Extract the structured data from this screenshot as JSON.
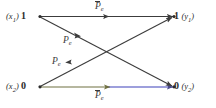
{
  "figure": {
    "type": "binary-symmetric-channel-diagram",
    "background_color": "#ffffff"
  },
  "nodes": {
    "input_top": {
      "paren_open": "(",
      "var": "x",
      "sub": "1",
      "paren_close": ")",
      "bit": "1"
    },
    "input_bottom": {
      "paren_open": "(",
      "var": "x",
      "sub": "2",
      "paren_close": ")",
      "bit": "0"
    },
    "output_top": {
      "paren_open": "(",
      "var": "y",
      "sub": "1",
      "paren_close": ")",
      "bit": "1"
    },
    "output_bottom": {
      "paren_open": "(",
      "var": "y",
      "sub": "2",
      "paren_close": ")",
      "bit": "0"
    }
  },
  "edges": {
    "top_straight": {
      "symbol": "P",
      "sub": "e",
      "overline": true,
      "label_text": "P̄e",
      "color": "#3c3c3c"
    },
    "bottom_straight": {
      "symbol": "P",
      "sub": "e",
      "overline": true,
      "label_text": "P̄e",
      "color": "#7c7fd0"
    },
    "cross_down": {
      "symbol": "P",
      "sub": "e",
      "overline": false,
      "label_text": "Pe",
      "color": "#3c3c3c"
    },
    "cross_up": {
      "symbol": "P",
      "sub": "e",
      "overline": false,
      "label_text": "Pe",
      "color": "#3c3c3c"
    }
  },
  "colors": {
    "line_dark": "#3c3c3c",
    "line_blue": "#7c7fd0",
    "line_olive": "#6f7040",
    "text": "#2b2b2b",
    "border": "#b9b9b9"
  }
}
